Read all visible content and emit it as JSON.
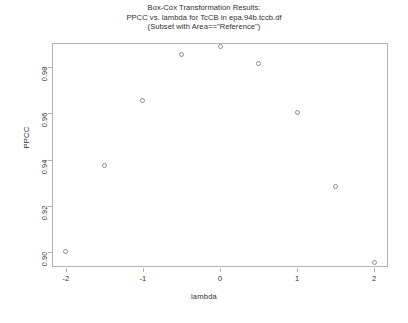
{
  "chart_data": {
    "type": "scatter",
    "title": "Box-Cox Transformation Results:",
    "title_lines": [
      "Box-Cox Transformation Results:",
      "PPCC vs. lambda for TcCB in epa.94b.tccb.df",
      "(Subset with Area==\"Reference\")"
    ],
    "subtitle": "PPCC vs. lambda for TcCB in epa.94b.tccb.df",
    "annotation": "(Subset with Area==\"Reference\")",
    "xlabel": "lambda",
    "ylabel": "PPCC",
    "xlim": [
      -2.18,
      2.18
    ],
    "ylim": [
      0.8935,
      0.9905
    ],
    "grid": false,
    "legend": null,
    "marker": "open-circle",
    "marker_color": "#8c8c8c",
    "x": [
      -2,
      -1.5,
      -1,
      -0.5,
      0,
      0.5,
      1,
      1.5,
      2
    ],
    "y": [
      0.9002,
      0.9375,
      0.9655,
      0.9855,
      0.9888,
      0.9815,
      0.9605,
      0.9285,
      0.8955
    ],
    "points": [
      {
        "lambda": -2,
        "ppcc": 0.9002
      },
      {
        "lambda": -1.5,
        "ppcc": 0.9375
      },
      {
        "lambda": -1,
        "ppcc": 0.9655
      },
      {
        "lambda": -0.5,
        "ppcc": 0.9855
      },
      {
        "lambda": 0,
        "ppcc": 0.9888
      },
      {
        "lambda": 0.5,
        "ppcc": 0.9815
      },
      {
        "lambda": 1,
        "ppcc": 0.9605
      },
      {
        "lambda": 1.5,
        "ppcc": 0.9285
      },
      {
        "lambda": 2,
        "ppcc": 0.8955
      }
    ],
    "xticks": [
      -2,
      -1,
      0,
      1,
      2
    ],
    "xticklabels": [
      "-2",
      "-1",
      "0",
      "1",
      "2"
    ],
    "yticks": [
      0.9,
      0.92,
      0.94,
      0.96,
      0.98
    ],
    "yticklabels": [
      "0.90",
      "0.92",
      "0.94",
      "0.96",
      "0.98"
    ]
  },
  "colors": {
    "background": "#ffffff",
    "axis": "#b4b4b4",
    "text": "#2f2f2f",
    "marker": "#8c8c8c"
  }
}
